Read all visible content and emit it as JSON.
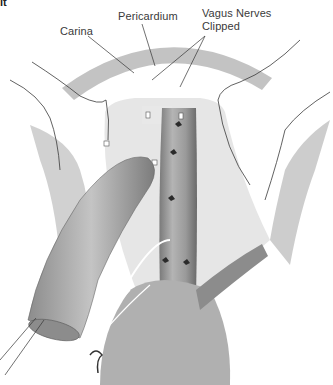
{
  "figure": {
    "corner_fragment": "it",
    "labels": {
      "carina": "Carina",
      "pericardium": "Pericardium",
      "vagus_line1": "Vagus Nerves",
      "vagus_line2": "Clipped"
    },
    "colors": {
      "background": "#ffffff",
      "outline": "#3a3a3a",
      "tissue_light": "#d6d6d6",
      "tissue_mid": "#a8a8a8",
      "tissue_dark": "#6e6e6e",
      "leader_line": "#333333"
    }
  }
}
